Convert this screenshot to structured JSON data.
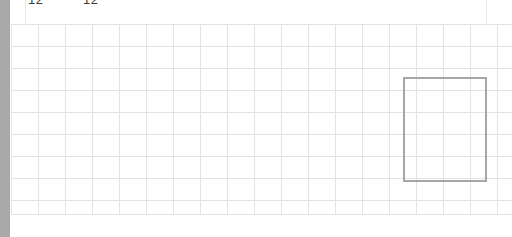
{
  "window": {
    "title": "Spreadsheet Grid Viewport",
    "width": 512,
    "height": 237,
    "background_color": "#ffffff"
  },
  "scrollbar": {
    "name": "vertical-scrollbar",
    "orientation": "vertical",
    "track_color": "#a8a8a8",
    "thumb_color": "#a8a8a8",
    "position": "left"
  },
  "header": {
    "labels": [
      {
        "text": "12",
        "clipped": true
      },
      {
        "text": "12",
        "clipped": true
      }
    ],
    "text_color": "#3a3a3a"
  },
  "grid": {
    "line_color": "#e3e3e3",
    "border_color": "#cfcfcf",
    "columns": 18,
    "rows": 8,
    "cell_width": 27,
    "cell_height": 22,
    "vertical_line_x": [
      0,
      27,
      54,
      81,
      108,
      135,
      162,
      189,
      216,
      243,
      270,
      297,
      324,
      351,
      378,
      405,
      432,
      459,
      486
    ],
    "horizontal_line_y": [
      0,
      22,
      44,
      66,
      88,
      110,
      132,
      154,
      176,
      190
    ]
  },
  "selection": {
    "name": "selected-cell-range",
    "border_color": "#a6a6a6",
    "border_width": 2,
    "x": 403,
    "y": 77,
    "width": 84,
    "height": 105,
    "fill": "transparent"
  }
}
